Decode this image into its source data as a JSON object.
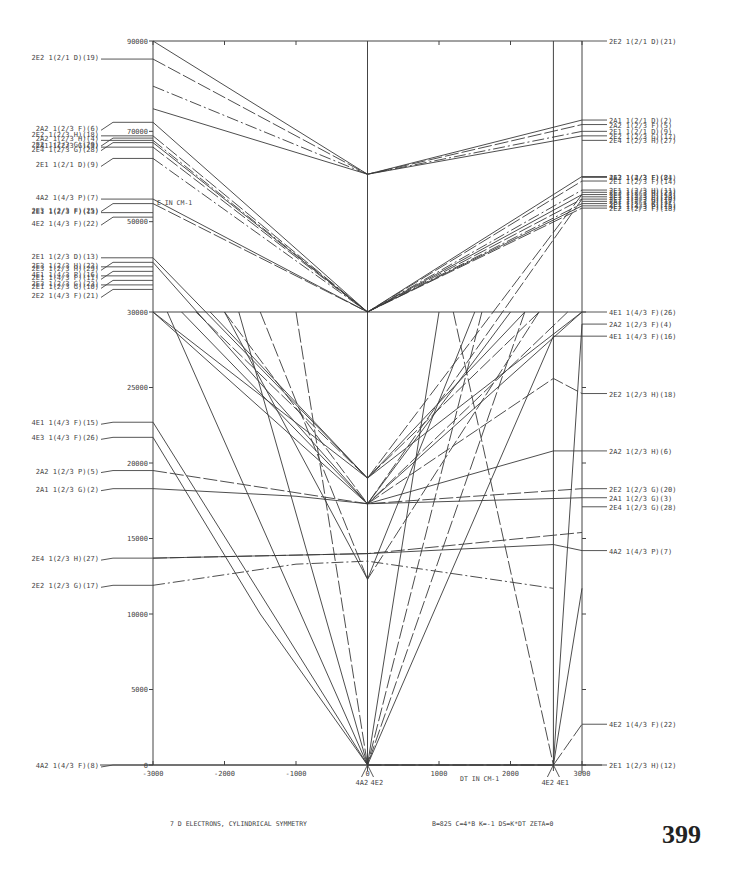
{
  "chart_data": {
    "type": "line",
    "title": "7 D ELECTRONS, CYLINDRICAL SYMMETRY",
    "parameters": "B=825   C=4*B   K=-1   DS=K*DT   ZETA=0",
    "xlabel": "DT IN CM-1",
    "ylabel": "E IN CM-1",
    "xlim": [
      -3000,
      3000
    ],
    "ylim": [
      0,
      90000
    ],
    "grid": false,
    "x_ticks": [
      "-3000",
      "-2000",
      "-1000",
      "0",
      "1000",
      "2000",
      "3000"
    ],
    "y_ticks_lower": [
      "0",
      "5000",
      "10000",
      "15000",
      "20000",
      "25000",
      "30000"
    ],
    "y_ticks_upper_compressed": [
      "30000",
      "50000",
      "70000",
      "90000"
    ],
    "bottom_markers": [
      {
        "x": 0,
        "labels": [
          "4A2",
          "4E2"
        ]
      },
      {
        "x": 2600,
        "labels": [
          "4E2",
          "4E1"
        ]
      }
    ],
    "left_labels": [
      {
        "text": "2E2 1(2/1 D)(19)",
        "y": 86000
      },
      {
        "text": "2A2 1(2/3 F)(6)",
        "y": 72000
      },
      {
        "text": "2E2 1(2/3 H)(18)",
        "y": 69000
      },
      {
        "text": "2E2 1(2/3 G)(20)",
        "y": 68500
      },
      {
        "text": "2A2 1(2/3 H)(4)",
        "y": 68000
      },
      {
        "text": "2E4 1(2/3 G)(28)",
        "y": 67500
      },
      {
        "text": "2A1 1(2/3 G)(3)",
        "y": 66500
      },
      {
        "text": "2E1 1(2/1 D)(9)",
        "y": 64000
      },
      {
        "text": "4A2 1(4/3 P)(7)",
        "y": 55000
      },
      {
        "text": "2E3 1(2/3 F)(25)",
        "y": 54000
      },
      {
        "text": "2E1 1(2/3 F)(13)",
        "y": 52000
      },
      {
        "text": "4E2 1(4/3 F)(22)",
        "y": 51000
      },
      {
        "text": "2E1 1(2/3 D)(13)",
        "y": 42000
      },
      {
        "text": "2E3 1(2/3 H)(29)",
        "y": 41000
      },
      {
        "text": "2E3 1(2/3 H)(23)",
        "y": 40000
      },
      {
        "text": "2E1 1(4/3 P)(11)",
        "y": 39000
      },
      {
        "text": "4E1 1(4/3 P)(16)",
        "y": 38000
      },
      {
        "text": "2E1 1(2/3 G)(10)",
        "y": 37000
      },
      {
        "text": "2E3 1(2/3 G)(23)",
        "y": 36000
      },
      {
        "text": "2E2 1(4/3 F)(21)",
        "y": 35000
      },
      {
        "text": "4E1 1(4/3 F)(15)",
        "y": 22700
      },
      {
        "text": "4E3 1(4/3 F)(26)",
        "y": 21700
      },
      {
        "text": "2A2 1(2/3 P)(5)",
        "y": 19500
      },
      {
        "text": "2A1 1(2/3 G)(2)",
        "y": 18300
      },
      {
        "text": "2E4 1(2/3 H)(27)",
        "y": 13700
      },
      {
        "text": "2E2 1(2/3 G)(17)",
        "y": 11900
      },
      {
        "text": "4A2 1(4/3 F)(8)",
        "y": 0
      }
    ],
    "right_labels": [
      {
        "text": "2E2 1(2/1 D)(21)",
        "y": 90000
      },
      {
        "text": "2A1 1(2/1 D)(2)",
        "y": 72500
      },
      {
        "text": "2A2 1(2/3 F)(5)",
        "y": 71500
      },
      {
        "text": "2E1 1(2/1 D)(9)",
        "y": 70000
      },
      {
        "text": "2E2 1(2/3 G)(17)",
        "y": 69000
      },
      {
        "text": "2E4 1(2/3 H)(27)",
        "y": 68000
      },
      {
        "text": "2E3 1(2/3 F)(24)",
        "y": 60000
      },
      {
        "text": "4A2 1(4/3 F)(8)",
        "y": 59800
      },
      {
        "text": "2E1 1(2/3 F)(14)",
        "y": 59000
      },
      {
        "text": "2E1 1(2/3 H)(11)",
        "y": 57000
      },
      {
        "text": "2E3 1(2/3 H)(23)",
        "y": 56500
      },
      {
        "text": "2E1 1(2/3 P)(13)",
        "y": 56000
      },
      {
        "text": "2E3 1(2/3 H)(29)",
        "y": 55500
      },
      {
        "text": "2E1 1(2/3 G)(10)",
        "y": 55000
      },
      {
        "text": "2A1 1(2/1 D)(1)",
        "y": 54500
      },
      {
        "text": "2E1 1(2/3 G)(25)",
        "y": 54000
      },
      {
        "text": "4E1 1(4/3 P)(15)",
        "y": 53500
      },
      {
        "text": "2E2 1(2/3 F)(18)",
        "y": 53000
      },
      {
        "text": "4E1 1(4/3 F)(26)",
        "y": 30000
      },
      {
        "text": "2A2 1(2/3 F)(4)",
        "y": 29200
      },
      {
        "text": "4E1 1(4/3 F)(16)",
        "y": 28400
      },
      {
        "text": "2E2 1(2/3 H)(18)",
        "y": 24600
      },
      {
        "text": "2A2 1(2/3 H)(6)",
        "y": 20800
      },
      {
        "text": "2E2 1(2/3 G)(20)",
        "y": 18300
      },
      {
        "text": "2A1 1(2/3 G)(3)",
        "y": 17700
      },
      {
        "text": "2E4 1(2/3 G)(28)",
        "y": 17100
      },
      {
        "text": "4A2 1(4/3 P)(7)",
        "y": 14200
      },
      {
        "text": "4E2 1(4/3 F)(22)",
        "y": 2700
      },
      {
        "text": "2E1 1(2/3 H)(12)",
        "y": 0
      }
    ],
    "series": [
      {
        "name": "4A2 (8) ground",
        "style": "solid",
        "x": [
          -3000,
          0,
          3000
        ],
        "y": [
          0,
          0,
          0
        ]
      },
      {
        "name": "4E1/4E3 F (15,26)",
        "style": "solid",
        "x": [
          -3000,
          0,
          2600
        ],
        "y": [
          22700,
          0,
          0
        ]
      },
      {
        "name": "4E1 F descending",
        "style": "solid",
        "x": [
          -3000,
          -1500,
          0
        ],
        "y": [
          21700,
          10000,
          0
        ]
      },
      {
        "name": "4E2 F rising",
        "style": "dash",
        "x": [
          0,
          2600,
          3000
        ],
        "y": [
          0,
          0,
          2700
        ]
      },
      {
        "name": "4E1 F (16)",
        "style": "solid",
        "x": [
          0,
          2600,
          3000
        ],
        "y": [
          0,
          28400,
          28400
        ]
      },
      {
        "name": "4A2 P (7)",
        "style": "solid",
        "x": [
          -3000,
          0,
          2600,
          3000
        ],
        "y": [
          13700,
          14000,
          14600,
          14200
        ]
      },
      {
        "name": "2A2 P (5)",
        "style": "dash",
        "x": [
          -3000,
          0,
          3000
        ],
        "y": [
          19500,
          17300,
          18300
        ]
      },
      {
        "name": "2A1 G (2)",
        "style": "solid",
        "x": [
          -3000,
          -1000,
          0,
          3000
        ],
        "y": [
          18300,
          17800,
          17300,
          17700
        ]
      },
      {
        "name": "2E4 H (27)",
        "style": "dash",
        "x": [
          -3000,
          0,
          3000
        ],
        "y": [
          13700,
          14000,
          15400
        ]
      },
      {
        "name": "2E2 G (17)",
        "style": "dashdot",
        "x": [
          -3000,
          -1000,
          0,
          2600
        ],
        "y": [
          11900,
          13300,
          13500,
          11700
        ]
      },
      {
        "name": "2E2 H (18)",
        "style": "dash",
        "x": [
          0,
          2600,
          3000
        ],
        "y": [
          17300,
          25600,
          24600
        ]
      },
      {
        "name": "2A2 H (6)",
        "style": "solid",
        "x": [
          0,
          2600,
          3000
        ],
        "y": [
          17300,
          20800,
          20800
        ]
      },
      {
        "name": "2E H upper",
        "style": "solid",
        "x": [
          -3000,
          0,
          3000
        ],
        "y": [
          30000,
          19000,
          30000
        ]
      },
      {
        "name": "2E H upper b",
        "style": "solid",
        "x": [
          -3000,
          0,
          3000
        ],
        "y": [
          30000,
          17300,
          30000
        ]
      }
    ]
  },
  "page": {
    "number": "399"
  }
}
